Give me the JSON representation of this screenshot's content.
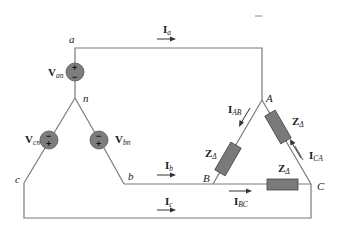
{
  "diagram": {
    "type": "balanced wye-delta three-phase circuit",
    "source_nodes": {
      "a": "a",
      "b": "b",
      "c": "c",
      "n": "n"
    },
    "load_nodes": {
      "A": "A",
      "B": "B",
      "C": "C"
    },
    "sources": [
      {
        "id": "Van",
        "main": "V",
        "sub": "an",
        "top_sign": "+",
        "bottom_sign": "−"
      },
      {
        "id": "Vbn",
        "main": "V",
        "sub": "bn",
        "top_sign": "−",
        "bottom_sign": "+"
      },
      {
        "id": "Vcn",
        "main": "V",
        "sub": "cn",
        "top_sign": "−",
        "bottom_sign": "+"
      }
    ],
    "line_currents": [
      {
        "id": "Ia",
        "main": "I",
        "sub": "a"
      },
      {
        "id": "Ib",
        "main": "I",
        "sub": "b"
      },
      {
        "id": "Ic",
        "main": "I",
        "sub": "c"
      }
    ],
    "phase_currents": [
      {
        "id": "IAB",
        "main": "I",
        "sub": "AB"
      },
      {
        "id": "IBC",
        "main": "I",
        "sub": "BC"
      },
      {
        "id": "ICA",
        "main": "I",
        "sub": "CA"
      }
    ],
    "impedances": [
      {
        "id": "Z_AB",
        "main": "Z",
        "sub": "Δ"
      },
      {
        "id": "Z_CA",
        "main": "Z",
        "sub": "Δ"
      },
      {
        "id": "Z_BC",
        "main": "Z",
        "sub": "Δ"
      }
    ],
    "colors": {
      "wire": "#7a7a7a",
      "component": "#7a7a7a",
      "text": "#222222"
    }
  }
}
